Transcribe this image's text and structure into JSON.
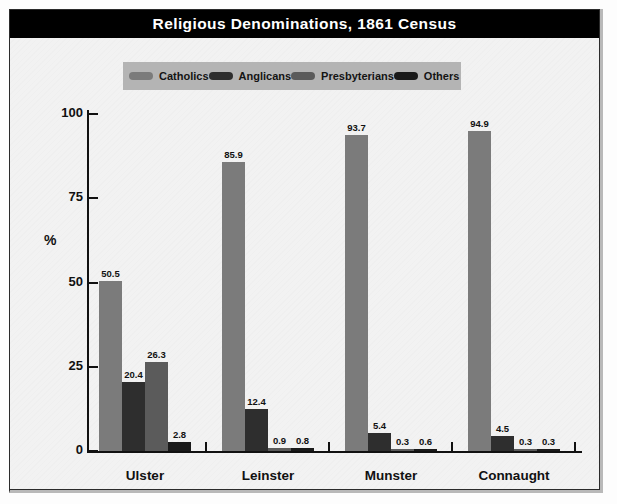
{
  "title": "Religious Denominations, 1861 Census",
  "chart_data": {
    "type": "bar",
    "title": "Religious Denominations, 1861 Census",
    "xlabel": "",
    "ylabel": "%",
    "ylim": [
      0,
      100
    ],
    "yticks": [
      "0",
      "25",
      "50",
      "75",
      "100"
    ],
    "ytick_values": [
      0,
      25,
      50,
      75,
      100
    ],
    "grid": false,
    "legend_position": "top",
    "categories": [
      "Ulster",
      "Leinster",
      "Munster",
      "Connaught"
    ],
    "series": [
      {
        "name": "Catholics",
        "color": "#7b7b7b",
        "values": [
          50.5,
          85.9,
          93.7,
          94.9
        ],
        "labels": [
          "50.5",
          "85.9",
          "93.7",
          "94.9"
        ]
      },
      {
        "name": "Anglicans",
        "color": "#2e2e2e",
        "values": [
          20.4,
          12.4,
          5.4,
          4.5
        ],
        "labels": [
          "20.4",
          "12.4",
          "5.4",
          "4.5"
        ]
      },
      {
        "name": "Presbyterians",
        "color": "#5b5b5b",
        "values": [
          26.3,
          0.9,
          0.3,
          0.3
        ],
        "labels": [
          "26.3",
          "0.9",
          "0.3",
          "0.3"
        ]
      },
      {
        "name": "Others",
        "color": "#1a1a1a",
        "values": [
          2.8,
          0.8,
          0.6,
          0.3
        ],
        "labels": [
          "2.8",
          "0.8",
          "0.6",
          "0.3"
        ]
      }
    ]
  },
  "colors": {
    "title_bar_background": "#000000",
    "title_text": "#ffffff",
    "legend_background": "#b4b4b4",
    "plot_background": "#f2f2f2",
    "axis": "#111111"
  }
}
